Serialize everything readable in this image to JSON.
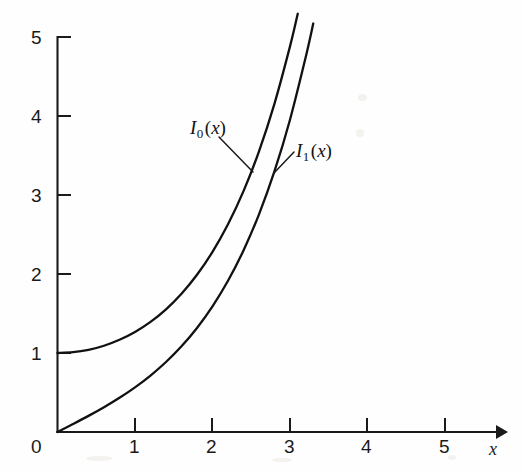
{
  "chart_data": {
    "type": "line",
    "title": "",
    "subtitle": "",
    "xlabel": "x",
    "ylabel": "",
    "xlim": [
      0,
      5.6
    ],
    "ylim": [
      0,
      5
    ],
    "grid": false,
    "legend_position": "inline-annotations",
    "x_ticks": [
      "0",
      "1",
      "2",
      "3",
      "4",
      "5"
    ],
    "x_tick_values": [
      0,
      1,
      2,
      3,
      4,
      5
    ],
    "y_ticks": [
      "1",
      "2",
      "3",
      "4",
      "5"
    ],
    "y_tick_values": [
      1,
      2,
      3,
      4,
      5
    ],
    "origin_label": "0",
    "series": [
      {
        "name": "I_0(x)",
        "label_parts": {
          "fn": "I",
          "sub": "0",
          "arg": "(x)"
        },
        "x": [
          0,
          0.2,
          0.4,
          0.6,
          0.8,
          1.0,
          1.2,
          1.4,
          1.6,
          1.8,
          2.0,
          2.2,
          2.4,
          2.6,
          2.8,
          3.0,
          3.1
        ],
        "values": [
          1.0,
          1.01,
          1.04,
          1.092,
          1.167,
          1.266,
          1.394,
          1.553,
          1.75,
          1.99,
          2.28,
          2.629,
          3.049,
          3.553,
          4.157,
          4.881,
          5.294
        ]
      },
      {
        "name": "I_1(x)",
        "label_parts": {
          "fn": "I",
          "sub": "1",
          "arg": "(x)"
        },
        "x": [
          0,
          0.2,
          0.4,
          0.6,
          0.8,
          1.0,
          1.2,
          1.4,
          1.6,
          1.8,
          2.0,
          2.2,
          2.4,
          2.6,
          2.8,
          3.0,
          3.2,
          3.3
        ],
        "values": [
          0.0,
          0.1005,
          0.204,
          0.3137,
          0.4329,
          0.5652,
          0.7147,
          0.8861,
          1.0848,
          1.3172,
          1.5906,
          1.9141,
          2.2981,
          2.7554,
          3.3011,
          3.9534,
          4.7343,
          5.1705
        ]
      }
    ],
    "annotations": [
      {
        "text": "I_0(x)",
        "x_px": 190,
        "y_px": 122,
        "leader_to_x_px": 253,
        "leader_to_y_px": 172
      },
      {
        "text": "I_1(x)",
        "x_px": 296,
        "y_px": 145,
        "leader_to_x_px": 274,
        "leader_to_y_px": 173
      }
    ],
    "axis_arrow": "x-axis-right-arrow"
  },
  "colors": {
    "curve": "#111111",
    "axis": "#1a1a1a",
    "background": "#fefefe"
  }
}
